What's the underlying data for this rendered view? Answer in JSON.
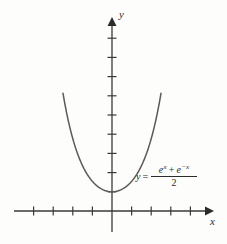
{
  "figure": {
    "background_color": "#fdfdfb",
    "ink_color": "#3a3a3a",
    "curve_color": "#5a5a5a"
  },
  "axes": {
    "x_label": "x",
    "y_label": "y",
    "origin_px": [
      112,
      211
    ],
    "x_axis": {
      "start_px": 14,
      "end_px": 209,
      "tick_spacing_px": 19.6,
      "ticks_left": 4,
      "ticks_right": 4,
      "tick_half_len_px": 4,
      "arrow": "right"
    },
    "y_axis": {
      "start_px": 232,
      "end_px": 18,
      "tick_spacing_px": 19.2,
      "ticks_above": 9,
      "tick_half_len_px": 4,
      "arrow": "up"
    }
  },
  "equation": {
    "lhs": "y",
    "equals": "=",
    "numerator_term1_base": "e",
    "numerator_term1_exp": "x",
    "numerator_operator": "+",
    "numerator_term2_base": "e",
    "numerator_term2_exp": "−x",
    "denominator": "2",
    "plain_text": "y = (e^x + e^-x) / 2"
  },
  "chart_data": {
    "type": "line",
    "title": "",
    "xlabel": "x",
    "ylabel": "y",
    "function": "y = (e^x + e^(-x)) / 2",
    "function_name": "hyperbolic cosine",
    "xlim": [
      -2.6,
      2.6
    ],
    "ylim": [
      0,
      9
    ],
    "grid": false,
    "legend": "none",
    "annotations": [
      {
        "text": "y = (e^x + e^-x)/2",
        "x": 1.3,
        "y": 1.4
      }
    ],
    "x": [
      -2.5,
      -2.25,
      -2.0,
      -1.75,
      -1.5,
      -1.25,
      -1.0,
      -0.75,
      -0.5,
      -0.25,
      0,
      0.25,
      0.5,
      0.75,
      1.0,
      1.25,
      1.5,
      1.75,
      2.0,
      2.25,
      2.5
    ],
    "y": [
      6.13,
      4.8,
      3.76,
      2.98,
      2.35,
      1.89,
      1.54,
      1.29,
      1.13,
      1.03,
      1.0,
      1.03,
      1.13,
      1.29,
      1.54,
      1.89,
      2.35,
      2.98,
      3.76,
      4.8,
      6.13
    ],
    "vertex": {
      "x": 0,
      "y": 1
    }
  }
}
